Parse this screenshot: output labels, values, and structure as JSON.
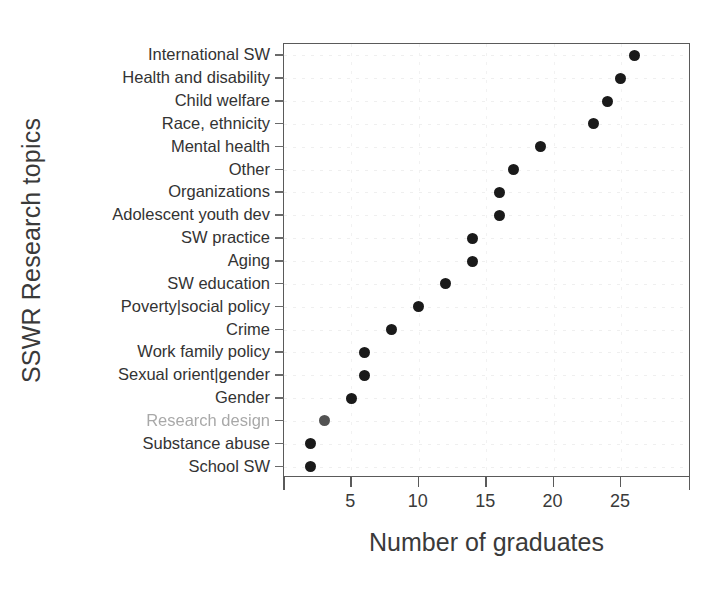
{
  "chart_data": {
    "type": "scatter",
    "title": "",
    "xlabel": "Number of graduates",
    "ylabel": "SSWR Research topics",
    "xlim": [
      0,
      30.2
    ],
    "xticks": [
      5,
      10,
      15,
      20,
      25
    ],
    "xticklabels": [
      "5",
      "10",
      "15",
      "20",
      "25"
    ],
    "grid": true,
    "legend": null,
    "orientation": "horizontal-dot-plot",
    "categories": [
      "International SW",
      "Health and disability",
      "Child welfare",
      "Race, ethnicity",
      "Mental health",
      "Other",
      "Organizations",
      "Adolescent youth dev",
      "SW practice",
      "Aging",
      "SW education",
      "Poverty|social policy",
      "Crime",
      "Work family policy",
      "Sexual orient|gender",
      "Gender",
      "Research design",
      "Substance abuse",
      "School SW"
    ],
    "values": [
      26,
      25,
      24,
      23,
      19,
      17,
      16,
      16,
      14,
      14,
      12,
      10,
      8,
      6,
      6,
      5,
      3,
      2,
      2
    ],
    "faded_categories": [
      "Research design"
    ],
    "marker": {
      "shape": "circle",
      "color": "#1a1a1a",
      "size_px": 11
    },
    "axis_color": "#5a5a5a",
    "grid_color": "#efefef",
    "background": "#ffffff"
  }
}
